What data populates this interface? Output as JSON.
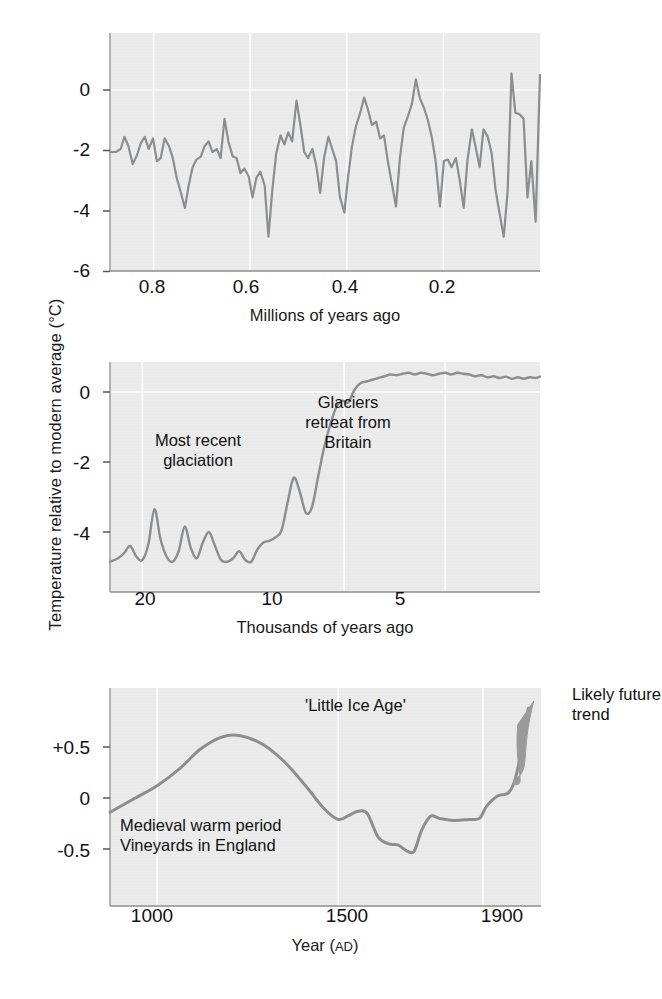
{
  "figure": {
    "shared_ylabel": "Temperature relative to modern average (°C)",
    "line_color": "#8b8d8f",
    "plot_bg_color": "#e9e9e9",
    "wedge_color": "#9a9a9a"
  },
  "chart_data": [
    {
      "id": "panel-top",
      "type": "line",
      "title": "",
      "xlabel": "Millions of years ago",
      "ylabel": "Temperature relative to modern average (°C)",
      "xticks": [
        0.8,
        0.6,
        0.4,
        0.2
      ],
      "xtick_labels": [
        "0.8",
        "0.6",
        "0.4",
        "0.2"
      ],
      "yticks": [
        0,
        -2,
        -4,
        -6
      ],
      "ytick_labels": [
        "0",
        "-2",
        "-4",
        "-6"
      ],
      "xlim": [
        0.89,
        0.0
      ],
      "ylim": [
        -6.4,
        1.4
      ],
      "x_reversed": true,
      "grid": "vertical-faint",
      "legend": "none",
      "annotations": [],
      "x": [
        0.89,
        0.878,
        0.868,
        0.86,
        0.852,
        0.843,
        0.834,
        0.826,
        0.818,
        0.81,
        0.801,
        0.793,
        0.785,
        0.777,
        0.768,
        0.76,
        0.752,
        0.744,
        0.735,
        0.727,
        0.719,
        0.711,
        0.702,
        0.694,
        0.686,
        0.678,
        0.669,
        0.661,
        0.653,
        0.645,
        0.636,
        0.628,
        0.62,
        0.612,
        0.603,
        0.595,
        0.587,
        0.579,
        0.57,
        0.562,
        0.554,
        0.546,
        0.537,
        0.529,
        0.521,
        0.513,
        0.504,
        0.496,
        0.488,
        0.48,
        0.471,
        0.463,
        0.455,
        0.447,
        0.438,
        0.43,
        0.422,
        0.414,
        0.405,
        0.397,
        0.389,
        0.381,
        0.372,
        0.364,
        0.356,
        0.348,
        0.339,
        0.331,
        0.323,
        0.315,
        0.306,
        0.298,
        0.29,
        0.282,
        0.273,
        0.265,
        0.257,
        0.249,
        0.24,
        0.232,
        0.224,
        0.216,
        0.207,
        0.199,
        0.191,
        0.183,
        0.174,
        0.166,
        0.158,
        0.15,
        0.141,
        0.133,
        0.125,
        0.117,
        0.108,
        0.1,
        0.092,
        0.084,
        0.075,
        0.067,
        0.059,
        0.051,
        0.042,
        0.034,
        0.026,
        0.018,
        0.009,
        0.0
      ],
      "values": [
        -2.05,
        -2.05,
        -1.95,
        -1.55,
        -1.85,
        -2.45,
        -2.15,
        -1.75,
        -1.55,
        -1.95,
        -1.6,
        -2.35,
        -2.25,
        -1.6,
        -1.85,
        -2.25,
        -2.9,
        -3.35,
        -3.9,
        -3.15,
        -2.55,
        -2.3,
        -2.2,
        -1.85,
        -1.7,
        -2.05,
        -1.95,
        -2.25,
        -0.95,
        -1.7,
        -2.2,
        -2.25,
        -2.75,
        -2.6,
        -2.85,
        -3.55,
        -2.9,
        -2.7,
        -3.15,
        -4.85,
        -3.3,
        -2.1,
        -1.5,
        -1.8,
        -1.4,
        -1.7,
        -0.35,
        -1.15,
        -2.05,
        -2.25,
        -1.95,
        -2.5,
        -3.4,
        -2.25,
        -1.55,
        -1.95,
        -2.35,
        -3.55,
        -4.05,
        -2.85,
        -1.85,
        -1.2,
        -0.75,
        -0.25,
        -0.65,
        -1.15,
        -1.05,
        -1.6,
        -1.5,
        -2.35,
        -3.15,
        -3.85,
        -2.25,
        -1.25,
        -0.85,
        -0.45,
        0.35,
        -0.25,
        -0.6,
        -1.0,
        -1.55,
        -2.35,
        -3.85,
        -2.35,
        -2.3,
        -2.55,
        -2.25,
        -3.0,
        -3.9,
        -2.3,
        -1.3,
        -1.9,
        -2.55,
        -1.3,
        -1.55,
        -2.1,
        -3.3,
        -4.05,
        -4.85,
        -3.35,
        0.55,
        -0.75,
        -0.8,
        -0.95,
        -3.55,
        -2.35,
        -4.35,
        0.5
      ]
    },
    {
      "id": "panel-middle",
      "type": "line",
      "title": "",
      "xlabel": "Thousands of years ago",
      "ylabel": "Temperature relative to modern average (°C)",
      "xticks": [
        20,
        10,
        5
      ],
      "xtick_labels": [
        "20",
        "10",
        "5"
      ],
      "yticks": [
        0,
        -2,
        -4
      ],
      "ytick_labels": [
        "0",
        "-2",
        "-4"
      ],
      "xlim": [
        21.6,
        0.3
      ],
      "ylim": [
        -5.4,
        1.2
      ],
      "x_reversed": true,
      "grid": "vertical-faint",
      "legend": "none",
      "annotations": [
        {
          "text": "Most recent\nglaciation",
          "x": 17.0,
          "y": -2.2
        },
        {
          "text": "Glaciers\nretreat from\nBritain",
          "x": 9.0,
          "y": -1.1
        }
      ],
      "x": [
        21.6,
        21.2,
        20.9,
        20.6,
        20.3,
        20.0,
        19.7,
        19.4,
        19.1,
        18.8,
        18.5,
        18.2,
        17.9,
        17.6,
        17.3,
        17.0,
        16.7,
        16.4,
        16.1,
        15.8,
        15.5,
        15.2,
        14.9,
        14.6,
        14.3,
        14.0,
        13.7,
        13.4,
        13.1,
        12.8,
        12.5,
        12.2,
        11.9,
        11.6,
        11.3,
        11.0,
        10.7,
        10.4,
        10.1,
        9.8,
        9.5,
        9.2,
        8.9,
        8.6,
        8.3,
        8.0,
        7.7,
        7.4,
        7.1,
        6.8,
        6.5,
        6.2,
        5.9,
        5.6,
        5.3,
        5.0,
        4.7,
        4.4,
        4.1,
        3.8,
        3.5,
        3.2,
        2.9,
        2.6,
        2.3,
        2.0,
        1.7,
        1.4,
        1.1,
        0.8,
        0.5,
        0.3
      ],
      "values": [
        -4.85,
        -4.75,
        -4.6,
        -4.4,
        -4.7,
        -4.8,
        -4.35,
        -3.35,
        -4.2,
        -4.7,
        -4.85,
        -4.55,
        -3.85,
        -4.45,
        -4.75,
        -4.3,
        -4.0,
        -4.4,
        -4.8,
        -4.85,
        -4.75,
        -4.55,
        -4.8,
        -4.85,
        -4.5,
        -4.3,
        -4.25,
        -4.15,
        -3.95,
        -3.15,
        -2.45,
        -2.85,
        -3.45,
        -3.3,
        -2.45,
        -1.6,
        -0.95,
        -0.45,
        -0.25,
        -0.3,
        0.05,
        0.25,
        0.3,
        0.35,
        0.4,
        0.45,
        0.5,
        0.48,
        0.52,
        0.55,
        0.5,
        0.55,
        0.52,
        0.48,
        0.52,
        0.55,
        0.5,
        0.55,
        0.52,
        0.5,
        0.45,
        0.48,
        0.42,
        0.45,
        0.4,
        0.44,
        0.38,
        0.42,
        0.38,
        0.42,
        0.4,
        0.44
      ]
    },
    {
      "id": "panel-bottom",
      "type": "line",
      "title": "",
      "xlabel": "Year (AD)",
      "ylabel": "Temperature relative to modern average (°C)",
      "xticks": [
        1000,
        1500,
        1900
      ],
      "xtick_labels": [
        "1000",
        "1500",
        "1900"
      ],
      "yticks": [
        0.5,
        0,
        -0.5
      ],
      "ytick_labels": [
        "+0.5",
        "0",
        "-0.5"
      ],
      "xlim": [
        870,
        2060
      ],
      "ylim": [
        -0.95,
        1.05
      ],
      "x_reversed": false,
      "grid": "vertical-faint",
      "legend": "none",
      "annotations": [
        {
          "text": "'Little Ice Age'",
          "x": 1640,
          "y": 0.83
        },
        {
          "text": "Medieval warm period\nVineyards in England",
          "x": 1180,
          "y": -0.38
        },
        {
          "text": "Likely future\ntrend",
          "x": 2070,
          "y": 0.95
        }
      ],
      "values": [
        {
          "year": 870,
          "t": -0.14
        },
        {
          "year": 930,
          "t": -0.02
        },
        {
          "year": 1000,
          "t": 0.12
        },
        {
          "year": 1060,
          "t": 0.28
        },
        {
          "year": 1120,
          "t": 0.48
        },
        {
          "year": 1180,
          "t": 0.6
        },
        {
          "year": 1230,
          "t": 0.61
        },
        {
          "year": 1290,
          "t": 0.53
        },
        {
          "year": 1350,
          "t": 0.36
        },
        {
          "year": 1410,
          "t": 0.12
        },
        {
          "year": 1460,
          "t": -0.1
        },
        {
          "year": 1500,
          "t": -0.21
        },
        {
          "year": 1530,
          "t": -0.17
        },
        {
          "year": 1555,
          "t": -0.13
        },
        {
          "year": 1580,
          "t": -0.15
        },
        {
          "year": 1610,
          "t": -0.38
        },
        {
          "year": 1640,
          "t": -0.45
        },
        {
          "year": 1665,
          "t": -0.46
        },
        {
          "year": 1690,
          "t": -0.52
        },
        {
          "year": 1710,
          "t": -0.52
        },
        {
          "year": 1730,
          "t": -0.32
        },
        {
          "year": 1755,
          "t": -0.18
        },
        {
          "year": 1780,
          "t": -0.2
        },
        {
          "year": 1820,
          "t": -0.22
        },
        {
          "year": 1860,
          "t": -0.21
        },
        {
          "year": 1890,
          "t": -0.2
        },
        {
          "year": 1910,
          "t": -0.08
        },
        {
          "year": 1940,
          "t": 0.02
        },
        {
          "year": 1970,
          "t": 0.05
        },
        {
          "year": 1990,
          "t": 0.2
        },
        {
          "year": 2010,
          "t": 0.55
        },
        {
          "year": 2025,
          "t": 0.88
        }
      ],
      "future_wedge": {
        "label": "Likely future trend",
        "start_year": 1985,
        "end_year": 2040,
        "start_t": 0.18,
        "end_t_low": 0.72,
        "end_t_high": 0.95
      }
    }
  ]
}
